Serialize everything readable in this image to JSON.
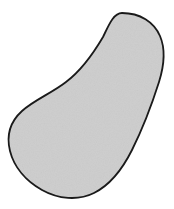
{
  "figure": {
    "title": "",
    "caption": "",
    "domain": "Natural-Image",
    "background_color": "#ffffff",
    "width": 174,
    "height": 209
  },
  "shape": {
    "name": "bean-shape",
    "description": "kidney bean silhouette",
    "fill_color": "#cdcdcd",
    "stroke_color": "#1a1a1a",
    "stroke_width": 1.8,
    "texture": "subtle-grain",
    "texture_opacity": 0.12,
    "path": "M 122 13 C 140 13 154 22 160 36 C 166 50 164 66 159 82 C 152 104 143 128 132 150 C 122 170 110 185 94 193 C 78 201 58 199 42 190 C 26 181 14 167 10 151 C 6 135 11 121 22 111 C 34 100 52 93 66 82 C 82 70 93 54 103 37 C 108 27 113 13 122 13 Z",
    "extremes": {
      "top": [
        122,
        13
      ],
      "right": [
        163,
        55
      ],
      "bottom": [
        90,
        196
      ],
      "left": [
        10,
        150
      ]
    },
    "concave_notch": {
      "start": [
        118,
        25
      ],
      "mid": [
        72,
        78
      ],
      "inflection": [
        30,
        125
      ]
    }
  },
  "labels": []
}
